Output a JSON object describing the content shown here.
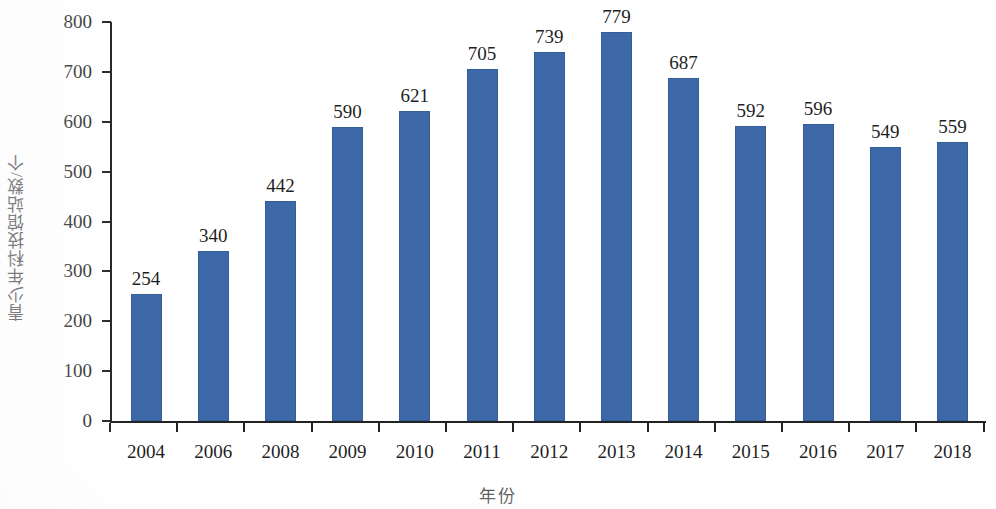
{
  "chart_data": {
    "type": "bar",
    "title": "",
    "xlabel": "年份",
    "ylabel": "青少年科技馆站数/个",
    "categories": [
      "2004",
      "2006",
      "2008",
      "2009",
      "2010",
      "2011",
      "2012",
      "2013",
      "2014",
      "2015",
      "2016",
      "2017",
      "2018"
    ],
    "values": [
      254,
      340,
      442,
      590,
      621,
      705,
      739,
      779,
      687,
      592,
      596,
      549,
      559
    ],
    "value_labels": [
      "254",
      "340",
      "442",
      "590",
      "621",
      "705",
      "739",
      "779",
      "687",
      "592",
      "596",
      "549",
      "559"
    ],
    "ylim": [
      0,
      800
    ],
    "yticks": [
      0,
      100,
      200,
      300,
      400,
      500,
      600,
      700,
      800
    ],
    "ytick_labels": [
      "0",
      "100",
      "200",
      "300",
      "400",
      "500",
      "600",
      "700",
      "800"
    ],
    "grid": false,
    "legend": null,
    "legend_position": "none",
    "series": [
      {
        "name": "青少年科技馆站数",
        "color": "#3E69A8",
        "values": [
          254,
          340,
          442,
          590,
          621,
          705,
          739,
          779,
          687,
          592,
          596,
          549,
          559
        ]
      }
    ],
    "bar_color": "#3E69A8",
    "axis_color": "#222222",
    "text_color": "#1F1F1F",
    "background": "#FFFFFF"
  }
}
